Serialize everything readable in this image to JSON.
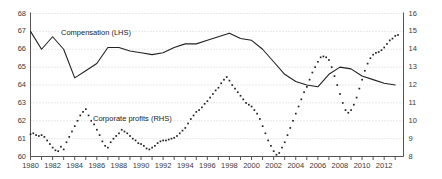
{
  "chart_data": {
    "type": "line",
    "title": "",
    "subtitle": "",
    "xlabel": "",
    "ylabel": "",
    "grid": true,
    "legend_position": "inline-annotation",
    "x_axis": {
      "min": 1980,
      "max": 2013.75,
      "tick_step": 1,
      "label_step": 2,
      "tick_labels": [
        "1980",
        "1982",
        "1984",
        "1986",
        "1988",
        "1990",
        "1992",
        "1994",
        "1996",
        "1998",
        "2000",
        "2002",
        "2004",
        "2006",
        "2008",
        "2010",
        "2012"
      ],
      "tick_values": [
        1980,
        1982,
        1984,
        1986,
        1988,
        1990,
        1992,
        1994,
        1996,
        1998,
        2000,
        2002,
        2004,
        2006,
        2008,
        2010,
        2012
      ]
    },
    "y_axis_left": {
      "label": "Compensation (LHS)",
      "min": 60,
      "max": 68,
      "tick_step": 1,
      "tick_labels": [
        "60",
        "61",
        "62",
        "63",
        "64",
        "65",
        "66",
        "67",
        "68"
      ],
      "tick_values": [
        60,
        61,
        62,
        63,
        64,
        65,
        66,
        67,
        68
      ]
    },
    "y_axis_right": {
      "label": "Corporate profits (RHS)",
      "min": 8,
      "max": 16,
      "tick_step": 1,
      "tick_labels": [
        "8",
        "9",
        "10",
        "11",
        "12",
        "13",
        "14",
        "15",
        "16"
      ],
      "tick_values": [
        8,
        9,
        10,
        11,
        12,
        13,
        14,
        15,
        16
      ]
    },
    "series": [
      {
        "name": "Compensation (LHS)",
        "axis": "left",
        "style": "solid",
        "color": "#222222",
        "annotation": "Compensation (LHS)",
        "x": [
          1980,
          1981,
          1982,
          1983,
          1984,
          1985,
          1986,
          1987,
          1988,
          1989,
          1990,
          1991,
          1992,
          1993,
          1994,
          1995,
          1996,
          1997,
          1998,
          1999,
          2000,
          2001,
          2002,
          2003,
          2004,
          2005,
          2006,
          2007,
          2008,
          2009,
          2010,
          2011,
          2012,
          2013
        ],
        "values": [
          67.0,
          66.0,
          66.7,
          66.0,
          64.4,
          64.8,
          65.2,
          66.1,
          66.1,
          65.9,
          65.8,
          65.7,
          65.8,
          66.1,
          66.3,
          66.3,
          66.5,
          66.7,
          66.9,
          66.6,
          66.5,
          66.0,
          65.3,
          64.6,
          64.2,
          64.0,
          63.9,
          64.6,
          65.0,
          64.9,
          64.5,
          64.3,
          64.1,
          64.0
        ]
      },
      {
        "name": "Corporate profits (RHS)",
        "axis": "right",
        "style": "dotted",
        "color": "#222222",
        "annotation": "Corporate profits (RHS)",
        "x": [
          1980.0,
          1980.25,
          1980.5,
          1980.75,
          1981.0,
          1981.25,
          1981.5,
          1981.75,
          1982.0,
          1982.25,
          1982.5,
          1982.75,
          1983.0,
          1983.25,
          1983.5,
          1983.75,
          1984.0,
          1984.25,
          1984.5,
          1984.75,
          1985.0,
          1985.25,
          1985.5,
          1985.75,
          1986.0,
          1986.25,
          1986.5,
          1986.75,
          1987.0,
          1987.25,
          1987.5,
          1987.75,
          1988.0,
          1988.25,
          1988.5,
          1988.75,
          1989.0,
          1989.25,
          1989.5,
          1989.75,
          1990.0,
          1990.25,
          1990.5,
          1990.75,
          1991.0,
          1991.25,
          1991.5,
          1991.75,
          1992.0,
          1992.25,
          1992.5,
          1992.75,
          1993.0,
          1993.25,
          1993.5,
          1993.75,
          1994.0,
          1994.25,
          1994.5,
          1994.75,
          1995.0,
          1995.25,
          1995.5,
          1995.75,
          1996.0,
          1996.25,
          1996.5,
          1996.75,
          1997.0,
          1997.25,
          1997.5,
          1997.75,
          1998.0,
          1998.25,
          1998.5,
          1998.75,
          1999.0,
          1999.25,
          1999.5,
          1999.75,
          2000.0,
          2000.25,
          2000.5,
          2000.75,
          2001.0,
          2001.25,
          2001.5,
          2001.75,
          2002.0,
          2002.25,
          2002.5,
          2002.75,
          2003.0,
          2003.25,
          2003.5,
          2003.75,
          2004.0,
          2004.25,
          2004.5,
          2004.75,
          2005.0,
          2005.25,
          2005.5,
          2005.75,
          2006.0,
          2006.25,
          2006.5,
          2006.75,
          2007.0,
          2007.25,
          2007.5,
          2007.75,
          2008.0,
          2008.25,
          2008.5,
          2008.75,
          2009.0,
          2009.25,
          2009.5,
          2009.75,
          2010.0,
          2010.25,
          2010.5,
          2010.75,
          2011.0,
          2011.25,
          2011.5,
          2011.75,
          2012.0,
          2012.25,
          2012.5,
          2012.75,
          2013.0,
          2013.25
        ],
        "values": [
          9.25,
          9.3,
          9.2,
          9.15,
          9.2,
          9.1,
          8.9,
          8.7,
          8.5,
          8.35,
          8.3,
          8.55,
          8.4,
          8.8,
          9.1,
          9.4,
          9.7,
          10.0,
          10.3,
          10.5,
          10.65,
          10.3,
          10.0,
          9.8,
          9.5,
          9.2,
          8.85,
          8.6,
          8.5,
          8.8,
          9.0,
          9.15,
          9.3,
          9.5,
          9.4,
          9.3,
          9.15,
          9.0,
          8.9,
          8.75,
          8.7,
          8.6,
          8.45,
          8.4,
          8.5,
          8.6,
          8.75,
          8.85,
          8.9,
          8.9,
          8.95,
          9.0,
          9.05,
          9.15,
          9.3,
          9.45,
          9.6,
          9.85,
          10.1,
          10.3,
          10.5,
          10.6,
          10.75,
          10.95,
          11.1,
          11.3,
          11.5,
          11.7,
          11.85,
          12.1,
          12.3,
          12.45,
          12.25,
          12.0,
          11.8,
          11.6,
          11.4,
          11.2,
          11.0,
          10.9,
          10.8,
          10.6,
          10.4,
          10.1,
          9.7,
          9.3,
          8.9,
          8.6,
          8.3,
          8.1,
          8.2,
          8.5,
          8.8,
          9.2,
          9.6,
          10.0,
          10.4,
          10.8,
          11.2,
          11.6,
          11.9,
          12.3,
          12.7,
          13.0,
          13.3,
          13.55,
          13.6,
          13.55,
          13.4,
          13.0,
          12.5,
          12.0,
          11.5,
          11.0,
          10.6,
          10.45,
          10.6,
          10.9,
          11.3,
          11.8,
          12.3,
          12.8,
          13.2,
          13.5,
          13.7,
          13.8,
          13.85,
          13.95,
          14.1,
          14.3,
          14.5,
          14.6,
          14.75,
          14.8
        ]
      }
    ]
  },
  "annotations": {
    "compensation": "Compensation (LHS)",
    "profits": "Corporate profits (RHS)"
  },
  "colors": {
    "line": "#222222",
    "axis": "#555555",
    "grid": "#c8c8c8",
    "text": "#3a3a3a"
  }
}
